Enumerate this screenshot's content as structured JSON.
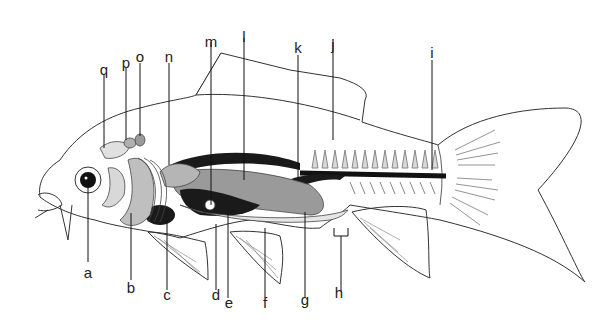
{
  "diagram": {
    "colors": {
      "outline": "#333333",
      "dark_organ": "#1a1a1a",
      "mid_organ": "#9a9a9a",
      "light_organ": "#c8c8c8",
      "pale_organ": "#e6e6e6",
      "leader": "#111111"
    },
    "labels": {
      "a": "a",
      "b": "b",
      "c": "c",
      "d": "d",
      "e": "e",
      "f": "f",
      "g": "g",
      "h": "h",
      "i": "i",
      "j": "j",
      "k": "k",
      "l": "l",
      "m": "m",
      "n": "n",
      "o": "o",
      "p": "p",
      "q": "q"
    }
  }
}
